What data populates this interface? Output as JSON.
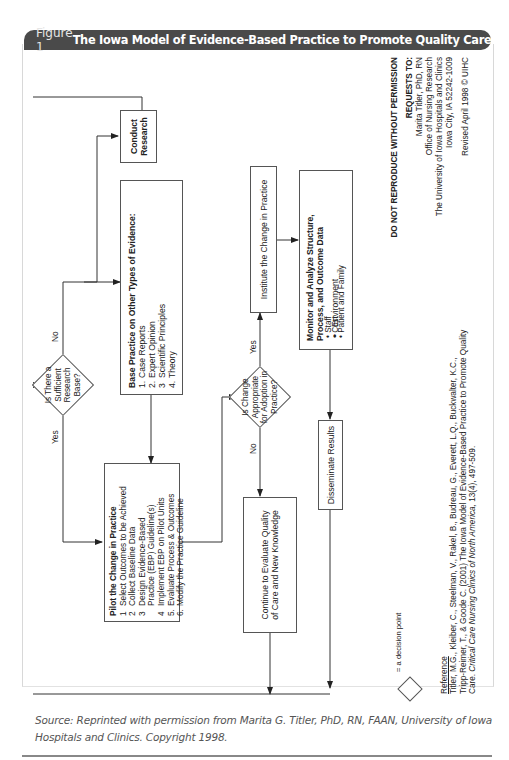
{
  "header": {
    "figure_label": "Figure 1",
    "title": "The Iowa Model of Evidence-Based Practice to Promote Quality Care (cont.)"
  },
  "diagram": {
    "decision_research": {
      "text": "Is There a Sufficient Research Base?",
      "yes": "Yes",
      "no": "No"
    },
    "conduct_research": {
      "text": "Conduct Research"
    },
    "base_practice": {
      "title": "Base Practice on Other Types of Evidence:",
      "items": [
        {
          "n": "1.",
          "text": "Case Reports"
        },
        {
          "n": "2.",
          "text": "Expert Opinion"
        },
        {
          "n": "3",
          "text": "Scientific Principles"
        },
        {
          "n": "4.",
          "text": "Theory"
        }
      ]
    },
    "pilot": {
      "title": "Pilot the Change in Practice",
      "items": [
        {
          "n": "1",
          "text": "Select Outcomes to be Achieved"
        },
        {
          "n": "2",
          "text": "Collect Baseline Data"
        },
        {
          "n": "3",
          "text": "Design Evidence-Based"
        },
        {
          "n": "",
          "text": "Practice (EBP) Guideline(s)"
        },
        {
          "n": "4",
          "text": "Implement EBP on Pilot Units"
        },
        {
          "n": "5.",
          "text": "Evaluate Process & Outcomes"
        },
        {
          "n": "6.",
          "text": "Modify the Practice Guideline"
        }
      ]
    },
    "decision_change": {
      "text": "Is Change Appropriate for Adoption in Practice?",
      "yes": "Yes",
      "no": "No"
    },
    "continue_evaluate": {
      "text": "Continue to Evaluate Quality of Care and New Knowledge"
    },
    "institute": {
      "text": "Institute the Change in Practice"
    },
    "monitor": {
      "title": "Monitor and Analyze Structure, Process, and Outcome Data",
      "items": [
        "Environment",
        "Staff",
        "Cost",
        "Patient and Family"
      ]
    },
    "disseminate": {
      "text": "Disseminate Results"
    }
  },
  "notes": {
    "do_not_reproduce": "DO NOT REPRODUCE WITHOUT PERMISSION",
    "requests_to": "REQUESTS TO:",
    "contact_lines": [
      "Marita Titler, PhD, RN",
      "Office of Nursing Research",
      "The University of Iowa Hospitals and Clinics",
      "Iowa City, IA  52242-1009"
    ],
    "revised": "Revised April 1998 © UIHC",
    "legend_text": "= a decision point",
    "reference_heading": "Reference",
    "reference_line1": "Titler, M.G., Kleiber, C., Steelman, V., Rakel, B., Budreau, G., Everett, L.Q., Buckwalter, K.C.,",
    "reference_line2": "Tripp-Reimer, T., & Goode C. (2001) The Iowa Model of Evidence-Based Practice to Promote Quality",
    "reference_line3_pre": "Care.  ",
    "reference_journal": "Critical Care Nursing Clinics of North America,",
    "reference_line3_post": " 13(4), 497-509."
  },
  "source": "Source: Reprinted with permission from Marita G. Titler, PhD, RN, FAAN, University of Iowa Hospitals and Clinics. Copyright 1998."
}
